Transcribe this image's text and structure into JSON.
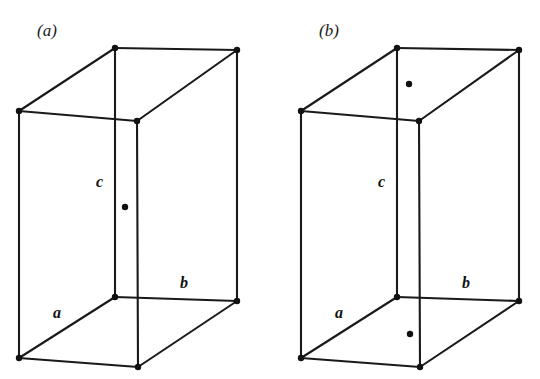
{
  "figure": {
    "type": "crystallographic-unit-cell-diagram",
    "background_color": "#ffffff",
    "line_color": "#1a1a1a",
    "dot_color": "#111111",
    "width": 540,
    "height": 379
  },
  "panels": [
    {
      "id": "a",
      "caption": "(a)",
      "caption_x": 37,
      "caption_y": 36,
      "description": "C-centred orthorhombic unit cell with one lattice point at the centre of the front face",
      "origin_x": 0,
      "axis_labels": [
        {
          "name": "a",
          "text": "a",
          "x": 53,
          "y": 318
        },
        {
          "name": "b",
          "text": "b",
          "x": 180,
          "y": 288
        },
        {
          "name": "c",
          "text": "c",
          "x": 96,
          "y": 187
        }
      ],
      "lattice_dots": [
        {
          "name": "face-centre-dot",
          "cx": 125,
          "cy": 207,
          "r": 3.2
        }
      ],
      "vertices": [
        {
          "name": "top-back-left",
          "x": 115,
          "y": 48
        },
        {
          "name": "top-back-right",
          "x": 237,
          "y": 50
        },
        {
          "name": "top-front-left",
          "x": 19,
          "y": 111
        },
        {
          "name": "top-front-right",
          "x": 137,
          "y": 121
        },
        {
          "name": "bottom-back-left",
          "x": 115,
          "y": 297
        },
        {
          "name": "bottom-back-right",
          "x": 237,
          "y": 301
        },
        {
          "name": "bottom-front-left",
          "x": 19,
          "y": 358
        },
        {
          "name": "bottom-front-right",
          "x": 138,
          "y": 367
        }
      ]
    },
    {
      "id": "b",
      "caption": "(b)",
      "caption_x": 319,
      "caption_y": 36,
      "description": "A-centred orthorhombic unit cell with lattice points at the centres of the top and bottom faces",
      "origin_x": 282,
      "axis_labels": [
        {
          "name": "a",
          "text": "a",
          "x": 335,
          "y": 318
        },
        {
          "name": "b",
          "text": "b",
          "x": 462,
          "y": 288
        },
        {
          "name": "c",
          "text": "c",
          "x": 378,
          "y": 187
        }
      ],
      "lattice_dots": [
        {
          "name": "top-face-centre-dot",
          "cx": 409,
          "cy": 84,
          "r": 3.2
        },
        {
          "name": "bottom-face-centre-dot",
          "cx": 410,
          "cy": 334,
          "r": 3.2
        }
      ],
      "vertices": [
        {
          "name": "top-back-left",
          "x": 397,
          "y": 48
        },
        {
          "name": "top-back-right",
          "x": 519,
          "y": 50
        },
        {
          "name": "top-front-left",
          "x": 301,
          "y": 111
        },
        {
          "name": "top-front-right",
          "x": 419,
          "y": 121
        },
        {
          "name": "bottom-back-left",
          "x": 397,
          "y": 297
        },
        {
          "name": "bottom-back-right",
          "x": 519,
          "y": 301
        },
        {
          "name": "bottom-front-left",
          "x": 301,
          "y": 358
        },
        {
          "name": "bottom-front-right",
          "x": 420,
          "y": 367
        }
      ]
    }
  ]
}
